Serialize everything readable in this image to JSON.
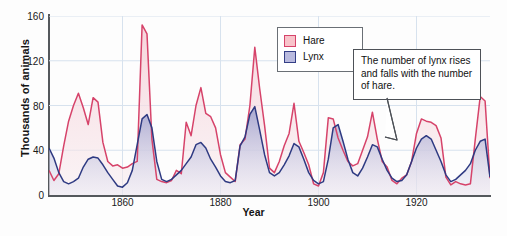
{
  "chart_data": {
    "type": "area",
    "title": "",
    "xlabel": "Year",
    "ylabel": "Thousands of animals",
    "xlim": [
      1845,
      1935
    ],
    "ylim": [
      0,
      160
    ],
    "xticks": [
      1860,
      1880,
      1900,
      1920
    ],
    "yticks": [
      0,
      40,
      80,
      120,
      160
    ],
    "grid": true,
    "legend_position": "top-right",
    "x": [
      1845,
      1846,
      1847,
      1848,
      1849,
      1850,
      1851,
      1852,
      1853,
      1854,
      1855,
      1856,
      1857,
      1858,
      1859,
      1860,
      1861,
      1862,
      1863,
      1864,
      1865,
      1866,
      1867,
      1868,
      1869,
      1870,
      1871,
      1872,
      1873,
      1874,
      1875,
      1876,
      1877,
      1878,
      1879,
      1880,
      1881,
      1882,
      1883,
      1884,
      1885,
      1886,
      1887,
      1888,
      1889,
      1890,
      1891,
      1892,
      1893,
      1894,
      1895,
      1896,
      1897,
      1898,
      1899,
      1900,
      1901,
      1902,
      1903,
      1904,
      1905,
      1906,
      1907,
      1908,
      1909,
      1910,
      1911,
      1912,
      1913,
      1914,
      1915,
      1916,
      1917,
      1918,
      1919,
      1920,
      1921,
      1922,
      1923,
      1924,
      1925,
      1926,
      1927,
      1928,
      1929,
      1930,
      1931,
      1932,
      1933,
      1934,
      1935
    ],
    "series": [
      {
        "name": "Hare",
        "color": "#d6436a",
        "fill": "#fadfe4",
        "values": [
          22,
          13,
          19,
          44,
          66,
          80,
          91,
          78,
          63,
          87,
          83,
          47,
          30,
          26,
          27,
          24,
          25,
          28,
          30,
          152,
          144,
          50,
          14,
          12,
          11,
          13,
          22,
          19,
          65,
          53,
          80,
          96,
          73,
          70,
          60,
          36,
          20,
          16,
          12,
          45,
          50,
          80,
          132,
          95,
          62,
          24,
          20,
          30,
          44,
          55,
          82,
          48,
          38,
          27,
          10,
          8,
          20,
          69,
          68,
          51,
          40,
          30,
          26,
          28,
          40,
          52,
          74,
          50,
          30,
          25,
          13,
          10,
          15,
          18,
          30,
          55,
          68,
          66,
          65,
          62,
          51,
          16,
          9,
          12,
          10,
          9,
          10,
          50,
          88,
          84,
          15
        ],
        "peaks": [
          {
            "year": 1864,
            "value": 152
          },
          {
            "year": 1886,
            "value": 132
          },
          {
            "year": 1876,
            "value": 96
          },
          {
            "year": 1934,
            "value": 88
          },
          {
            "year": 1895,
            "value": 82
          },
          {
            "year": 1854,
            "value": 87
          }
        ]
      },
      {
        "name": "Lynx",
        "color": "#2e3a82",
        "fill": "#c9cbe6",
        "values": [
          42,
          33,
          20,
          12,
          10,
          12,
          15,
          25,
          32,
          34,
          33,
          27,
          20,
          14,
          8,
          7,
          11,
          22,
          45,
          68,
          72,
          60,
          30,
          14,
          12,
          14,
          18,
          22,
          28,
          34,
          45,
          47,
          42,
          32,
          25,
          17,
          12,
          11,
          13,
          44,
          52,
          72,
          79,
          58,
          36,
          20,
          17,
          20,
          27,
          35,
          46,
          43,
          32,
          20,
          13,
          10,
          12,
          32,
          60,
          63,
          48,
          32,
          20,
          17,
          24,
          34,
          45,
          43,
          32,
          22,
          15,
          12,
          13,
          18,
          30,
          42,
          50,
          53,
          50,
          40,
          30,
          18,
          12,
          14,
          18,
          22,
          28,
          40,
          48,
          50,
          16
        ]
      }
    ],
    "annotation": {
      "text": "The number of lynx rises and falls with the number of hare.",
      "points_to": {
        "series": "Lynx",
        "year": 1925,
        "value": 53
      }
    }
  },
  "legend": {
    "items": [
      {
        "label": "Hare"
      },
      {
        "label": "Lynx"
      }
    ]
  },
  "axes": {
    "ylabel": "Thousands of animals",
    "xlabel": "Year",
    "ytick_labels": [
      "0",
      "40",
      "80",
      "120",
      "160"
    ],
    "xtick_labels": [
      "1860",
      "1880",
      "1900",
      "1920"
    ]
  },
  "colors": {
    "hare_line": "#d6436a",
    "hare_fill": "#fadfe4",
    "lynx_line": "#2e3a82",
    "lynx_fill": "#c9cbe6",
    "grid": "#d7e2ee",
    "axis": "#54585c"
  }
}
